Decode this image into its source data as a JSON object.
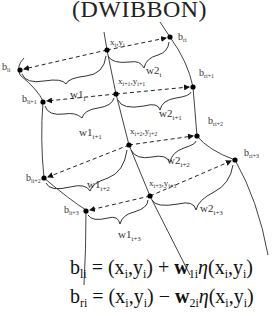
{
  "title": "(DWIBBON)",
  "diagram": {
    "center_points": [
      {
        "label_main": "x",
        "label_sub": "i",
        "label_main2": ",y",
        "label_sub2": "i"
      },
      {
        "label_main": "x",
        "label_sub": "i+1",
        "label_main2": ",y",
        "label_sub2": "i+1"
      },
      {
        "label_main": "x",
        "label_sub": "i+2",
        "label_main2": ",y",
        "label_sub2": "j+2"
      },
      {
        "label_main": "x",
        "label_sub": "i+3",
        "label_main2": ",y",
        "label_sub2": "j+3"
      }
    ],
    "left_points": [
      {
        "main": "b",
        "sub": "li"
      },
      {
        "main": "b",
        "sub": "li+1"
      },
      {
        "main": "b",
        "sub": "li+2"
      },
      {
        "main": "b",
        "sub": "li+3"
      }
    ],
    "right_points": [
      {
        "main": "b",
        "sub": "ri"
      },
      {
        "main": "b",
        "sub": "ri+1"
      },
      {
        "main": "b",
        "sub": "ri+2"
      },
      {
        "main": "b",
        "sub": "ri+3"
      }
    ],
    "left_widths": [
      {
        "main": "w1",
        "sub": "i"
      },
      {
        "main": "w1",
        "sub": "i+1"
      },
      {
        "main": "w1",
        "sub": "i+2"
      },
      {
        "main": "w1",
        "sub": "i+3"
      }
    ],
    "right_widths": [
      {
        "main": "w2",
        "sub": "i"
      },
      {
        "main": "w2",
        "sub": "i+1"
      },
      {
        "main": "w2",
        "sub": "i+2"
      },
      {
        "main": "w2",
        "sub": "i+3"
      }
    ]
  },
  "equations": [
    {
      "lhs": "b",
      "lhs_sub": "li",
      "eq": " = (x",
      "s1": "i",
      "m1": ",y",
      "s2": "i",
      "m2": ") + ",
      "w": "w",
      "w_sub": "1i",
      "eta": "η",
      "rest": "(x",
      "s3": "i",
      "m3": ",y",
      "s4": "i",
      "end": ")"
    },
    {
      "lhs": "b",
      "lhs_sub": "ri",
      "eq": " = (x",
      "s1": "i",
      "m1": ",y",
      "s2": "i",
      "m2": ") − ",
      "w": "w",
      "w_sub": "2i",
      "eta": "η",
      "rest": "(x",
      "s3": "i",
      "m3": ",y",
      "s4": "i",
      "end": ")"
    }
  ]
}
